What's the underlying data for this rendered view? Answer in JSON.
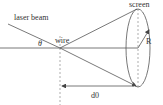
{
  "diagram": {
    "labels": {
      "laser_beam": "laser beam",
      "wire": "wire",
      "screen": "screen",
      "angle": "θ",
      "radius": "R",
      "distance": "d0"
    },
    "colors": {
      "line": "#555555",
      "text": "#333333"
    }
  }
}
